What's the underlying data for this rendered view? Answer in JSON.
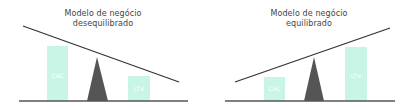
{
  "colors": {
    "bar": "#c8f5e6",
    "fulcrum": "#555555",
    "beam": "#333333",
    "baseline": "#555555",
    "text": "#444444"
  },
  "panels": [
    {
      "title_line1": "Modelo de negócio",
      "title_line2": "desequilibrado",
      "bars": [
        {
          "label": "CAC",
          "size": "large"
        },
        {
          "label": "LTV",
          "size": "small"
        }
      ],
      "tilt": "down-right"
    },
    {
      "title_line1": "Modelo de negócio",
      "title_line2": "equilibrado",
      "bars": [
        {
          "label": "CAC",
          "size": "small"
        },
        {
          "label": "LTV",
          "size": "large"
        }
      ],
      "tilt": "up-right"
    }
  ]
}
